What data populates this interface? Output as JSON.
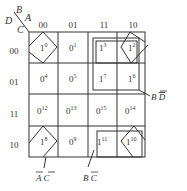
{
  "kmap": {
    "corner": {
      "top_vars": "BA",
      "left_vars": "DC",
      "B": "B",
      "A": "A",
      "D": "D",
      "C": "C"
    },
    "col_labels": [
      "00",
      "01",
      "11",
      "10"
    ],
    "row_labels": [
      "00",
      "01",
      "11",
      "10"
    ],
    "cells": [
      [
        {
          "v": "1",
          "m": "0"
        },
        {
          "v": "0",
          "m": "1"
        },
        {
          "v": "1",
          "m": "3"
        },
        {
          "v": "1",
          "m": "2"
        }
      ],
      [
        {
          "v": "0",
          "m": "4"
        },
        {
          "v": "0",
          "m": "5"
        },
        {
          "v": "1",
          "m": "7"
        },
        {
          "v": "1",
          "m": "6"
        }
      ],
      [
        {
          "v": "0",
          "m": "12"
        },
        {
          "v": "0",
          "m": "13"
        },
        {
          "v": "0",
          "m": "15"
        },
        {
          "v": "0",
          "m": "14"
        }
      ],
      [
        {
          "v": "1",
          "m": "8"
        },
        {
          "v": "0",
          "m": "9"
        },
        {
          "v": "1",
          "m": "11"
        },
        {
          "v": "1",
          "m": "10"
        }
      ]
    ],
    "groups": [
      {
        "label_main": "B",
        "label_bar": "D",
        "text": "B D̄"
      },
      {
        "label_bar1": "A",
        "label_bar2": "C",
        "text": "Ā C̄"
      },
      {
        "label_main": "B",
        "label_bar": "C",
        "text": "B C̄"
      }
    ]
  }
}
